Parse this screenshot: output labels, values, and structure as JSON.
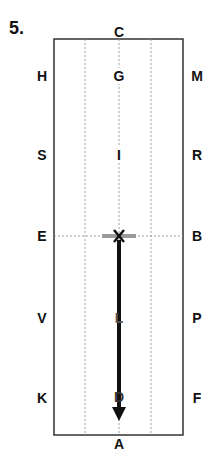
{
  "figure": {
    "number": "5.",
    "type": "dressage arena diagram",
    "letters": {
      "top": "C",
      "bottom": "A",
      "left": [
        "H",
        "S",
        "E",
        "V",
        "K"
      ],
      "right": [
        "M",
        "R",
        "B",
        "P",
        "F"
      ],
      "centerline": [
        "G",
        "I",
        "X",
        "L",
        "D"
      ]
    },
    "path": {
      "from": "X",
      "to": "D",
      "direction": "down",
      "halt_marker_at": "X"
    },
    "colors": {
      "line": "#111111",
      "border": "#333333",
      "guide": "#888888",
      "halt_bar": "#9a9a9a"
    }
  }
}
